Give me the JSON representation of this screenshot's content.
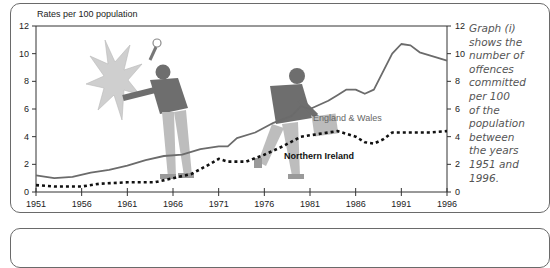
{
  "caption": {
    "lines": [
      "Graph (i)",
      "shows the",
      "number of",
      "offences",
      "committed",
      "per 100",
      "of the",
      "population",
      "between",
      "the years",
      "1951 and",
      "1996."
    ]
  },
  "chart_data": {
    "type": "line",
    "title": "",
    "ylabel": "Rates per 100 population",
    "xlabel": "",
    "x_ticks": [
      "1951",
      "1956",
      "1961",
      "1966",
      "1971",
      "1976",
      "1981",
      "1986",
      "1991",
      "1996"
    ],
    "y_ticks_left": [
      "0",
      "2",
      "4",
      "6",
      "8",
      "10",
      "12"
    ],
    "y_ticks_right": [
      "0",
      "2",
      "4",
      "6",
      "8",
      "10",
      "12"
    ],
    "xlim": [
      1951,
      1996
    ],
    "ylim": [
      0,
      12
    ],
    "grid": false,
    "legend_position": "inline labels",
    "series": [
      {
        "name": "England & Wales",
        "style": "solid",
        "color": "#6b6b6b",
        "x": [
          1951,
          1953,
          1955,
          1957,
          1959,
          1961,
          1963,
          1965,
          1967,
          1969,
          1971,
          1972,
          1973,
          1975,
          1977,
          1979,
          1980,
          1981,
          1983,
          1984,
          1985,
          1986,
          1987,
          1988,
          1990,
          1991,
          1992,
          1993,
          1995,
          1996
        ],
        "values": [
          1.2,
          1.0,
          1.1,
          1.4,
          1.6,
          1.9,
          2.3,
          2.6,
          2.7,
          3.1,
          3.3,
          3.3,
          3.9,
          4.3,
          5.0,
          5.5,
          6.2,
          6.0,
          6.6,
          7.0,
          7.4,
          7.4,
          7.1,
          7.4,
          10.0,
          10.7,
          10.6,
          10.1,
          9.7,
          9.5
        ]
      },
      {
        "name": "Northern Ireland",
        "style": "dotted",
        "color": "#111111",
        "x": [
          1951,
          1953,
          1956,
          1958,
          1961,
          1964,
          1966,
          1968,
          1970,
          1971,
          1972,
          1974,
          1976,
          1978,
          1980,
          1982,
          1984,
          1985,
          1986,
          1987,
          1988,
          1989,
          1990,
          1992,
          1994,
          1996
        ],
        "values": [
          0.5,
          0.4,
          0.4,
          0.6,
          0.7,
          0.7,
          1.0,
          1.3,
          2.0,
          2.4,
          2.2,
          2.2,
          2.7,
          3.3,
          4.0,
          4.2,
          4.4,
          4.2,
          4.0,
          3.6,
          3.5,
          3.8,
          4.3,
          4.3,
          4.3,
          4.4
        ]
      }
    ],
    "annotations": [
      "England & Wales",
      "Northern Ireland"
    ]
  }
}
